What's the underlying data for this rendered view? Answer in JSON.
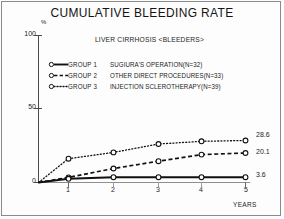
{
  "chart_data": {
    "type": "line",
    "title": "CUMULATIVE BLEEDING RATE",
    "subtitle": "LIVER CIRRHOSIS <BLEEDERS>",
    "xlabel": "YEARS",
    "ylabel": "%",
    "x": [
      0,
      1,
      2,
      3,
      4,
      5
    ],
    "xtick_labels": [
      "1",
      "2",
      "3",
      "4",
      "5"
    ],
    "xticks": [
      1,
      2,
      3,
      4,
      5
    ],
    "ytick_labels": [
      "100",
      "50",
      "0"
    ],
    "yticks": [
      100,
      50,
      0
    ],
    "xlim": [
      0,
      5
    ],
    "ylim": [
      0,
      100
    ],
    "grid": false,
    "legend_position": "upper-left-inside",
    "series": [
      {
        "name": "GROUP 1",
        "description": "SUGIURA'S OPERATION(N=32)",
        "n": 32,
        "style": "solid",
        "marker": "open-circle",
        "color": "#111111",
        "values": [
          0,
          2.5,
          3.6,
          3.6,
          3.6,
          3.6
        ],
        "end_label": "3.6"
      },
      {
        "name": "GROUP 2",
        "description": "OTHER DIRECT PROCEDURES(N=33)",
        "n": 33,
        "style": "dashed",
        "marker": "open-circle",
        "color": "#111111",
        "values": [
          0,
          3.5,
          9.5,
          14.5,
          19.0,
          20.1
        ],
        "end_label": "20.1"
      },
      {
        "name": "GROUP 3",
        "description": "INJECTION SCLEROTHERAPY(N=39)",
        "n": 39,
        "style": "dotted",
        "marker": "open-circle",
        "color": "#111111",
        "values": [
          0,
          16.2,
          20.5,
          26.2,
          28.0,
          28.6
        ],
        "end_label": "28.6"
      }
    ]
  },
  "header": {
    "title": "CUMULATIVE BLEEDING RATE",
    "subtitle": "LIVER CIRRHOSIS <BLEEDERS>"
  },
  "axes": {
    "y_unit": "%",
    "y_tick_100": "100",
    "y_tick_50": "50",
    "y_tick_0": "0",
    "x_tick_1": "1",
    "x_tick_2": "2",
    "x_tick_3": "3",
    "x_tick_4": "4",
    "x_tick_5": "5",
    "x_axis_title": "YEARS"
  },
  "legend": {
    "items": [
      {
        "group": "GROUP 1",
        "desc": "SUGIURA'S OPERATION(N=32)"
      },
      {
        "group": "GROUP 2",
        "desc": "OTHER DIRECT PROCEDURES(N=33)"
      },
      {
        "group": "GROUP 3",
        "desc": "INJECTION SCLEROTHERAPY(N=39)"
      }
    ]
  },
  "end_labels": {
    "group3": "28.6",
    "group2": "20.1",
    "group1": "3.6"
  }
}
